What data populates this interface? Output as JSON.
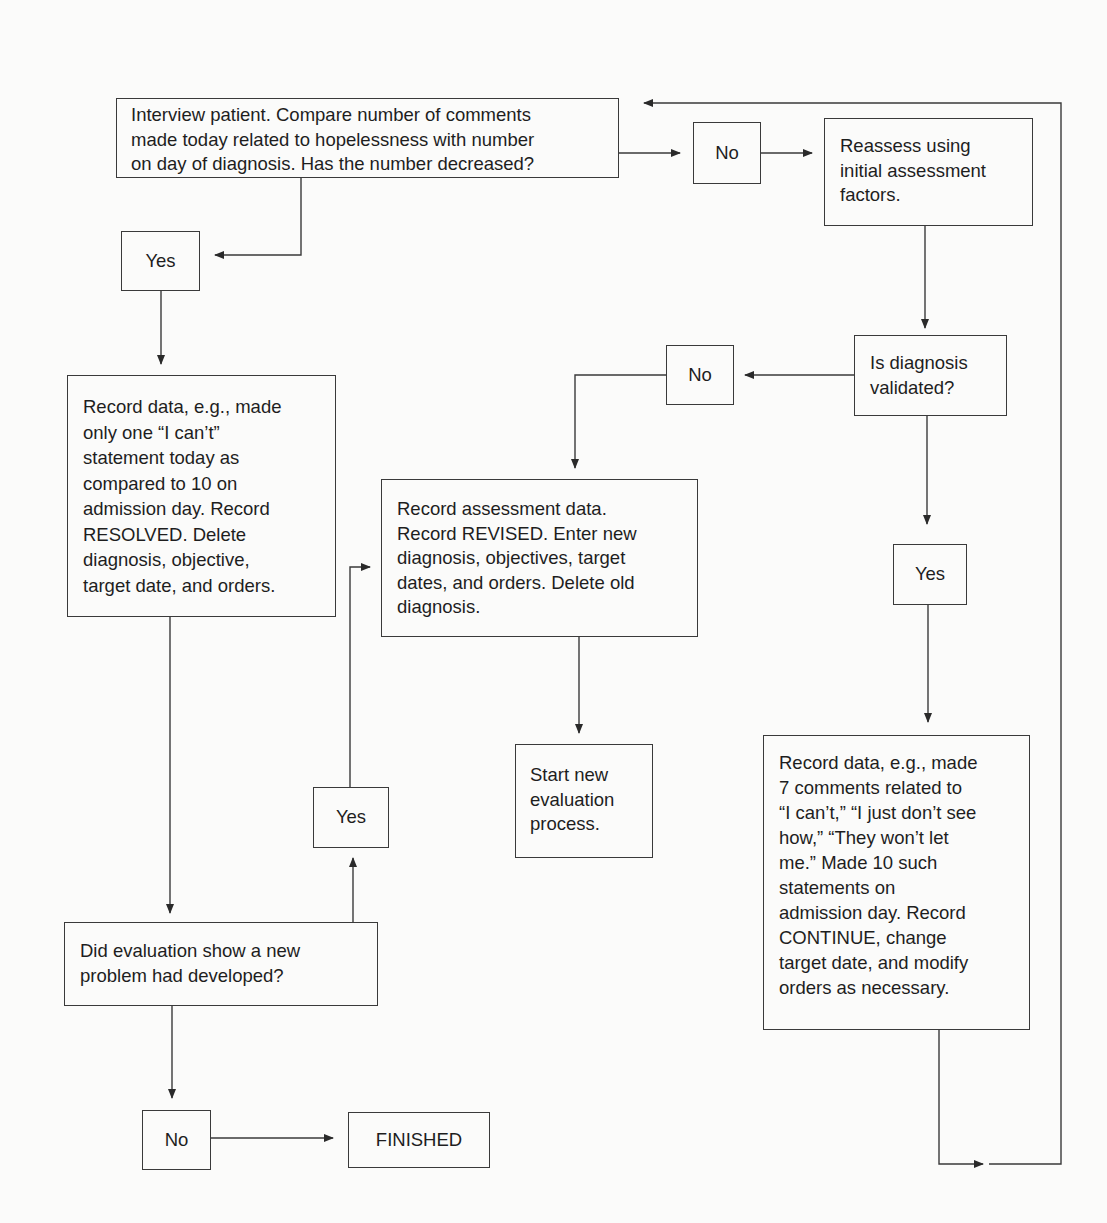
{
  "diagram": {
    "nodes": {
      "interview": {
        "lines": [
          "Interview patient. Compare number of comments",
          "made today related to hopelessness with number",
          "on day of diagnosis. Has the number decreased?"
        ]
      },
      "no_1": {
        "label": "No"
      },
      "reassess": {
        "lines": [
          "Reassess using",
          "initial assessment",
          "factors."
        ]
      },
      "yes_1": {
        "label": "Yes"
      },
      "record_resolved": {
        "lines": [
          "Record data, e.g., made",
          "only one “I can’t”",
          "statement today as",
          "compared to 10 on",
          "admission day. Record",
          "RESOLVED. Delete",
          "diagnosis, objective,",
          "target date, and orders."
        ]
      },
      "no_2": {
        "label": "No"
      },
      "validated": {
        "lines": [
          "Is diagnosis",
          "validated?"
        ]
      },
      "record_revised": {
        "lines": [
          "Record assessment data.",
          "Record REVISED. Enter new",
          "diagnosis, objectives, target",
          "dates, and orders. Delete old",
          "diagnosis."
        ]
      },
      "yes_new_problem": {
        "label": "Yes"
      },
      "start_new": {
        "lines": [
          "Start new",
          "evaluation",
          "process."
        ]
      },
      "yes_validated": {
        "label": "Yes"
      },
      "record_continue": {
        "lines": [
          "Record data, e.g., made",
          "7 comments related to",
          "“I can’t,” “I just don’t see",
          "how,” “They won’t let",
          "me.” Made 10 such",
          "statements on",
          "admission day. Record",
          "CONTINUE, change",
          "target date, and modify",
          "orders as necessary."
        ]
      },
      "new_problem": {
        "lines": [
          "Did evaluation show a new",
          "problem had developed?"
        ]
      },
      "no_3": {
        "label": "No"
      },
      "finished": {
        "label": "FINISHED"
      }
    },
    "edges": [
      {
        "from": "interview",
        "to": "no_1",
        "label": ""
      },
      {
        "from": "no_1",
        "to": "reassess",
        "label": ""
      },
      {
        "from": "interview",
        "to": "yes_1",
        "label": ""
      },
      {
        "from": "yes_1",
        "to": "record_resolved",
        "label": ""
      },
      {
        "from": "reassess",
        "to": "validated",
        "label": ""
      },
      {
        "from": "validated",
        "to": "no_2",
        "label": ""
      },
      {
        "from": "no_2",
        "to": "record_revised",
        "label": ""
      },
      {
        "from": "validated",
        "to": "yes_validated",
        "label": ""
      },
      {
        "from": "yes_validated",
        "to": "record_continue",
        "label": ""
      },
      {
        "from": "record_revised",
        "to": "start_new",
        "label": ""
      },
      {
        "from": "record_resolved",
        "to": "new_problem",
        "label": ""
      },
      {
        "from": "new_problem",
        "to": "yes_new_problem",
        "label": ""
      },
      {
        "from": "yes_new_problem",
        "to": "record_revised",
        "label": ""
      },
      {
        "from": "new_problem",
        "to": "no_3",
        "label": ""
      },
      {
        "from": "no_3",
        "to": "finished",
        "label": ""
      },
      {
        "from": "record_continue",
        "to": "interview",
        "label": ""
      }
    ]
  }
}
